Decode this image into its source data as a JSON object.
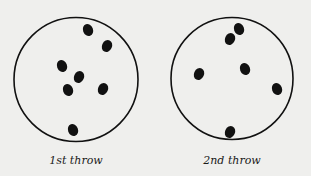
{
  "colors": {
    "background": "#efefed",
    "ink": "#111111"
  },
  "panels": [
    {
      "label": "1st throw",
      "label_pos": [
        76,
        154
      ],
      "circle": {
        "cx": 76,
        "cy": 79.5,
        "r": 62
      },
      "dots": [
        [
          88,
          30
        ],
        [
          107,
          46
        ],
        [
          62,
          66
        ],
        [
          79,
          77
        ],
        [
          68,
          90
        ],
        [
          103,
          89
        ],
        [
          73,
          130
        ]
      ]
    },
    {
      "label": "2nd throw",
      "label_pos": [
        232,
        154
      ],
      "circle": {
        "cx": 232,
        "cy": 78.5,
        "r": 61
      },
      "dots": [
        [
          239,
          29
        ],
        [
          230,
          39
        ],
        [
          245,
          69
        ],
        [
          199,
          74
        ],
        [
          277,
          89
        ],
        [
          230,
          132
        ]
      ]
    }
  ]
}
